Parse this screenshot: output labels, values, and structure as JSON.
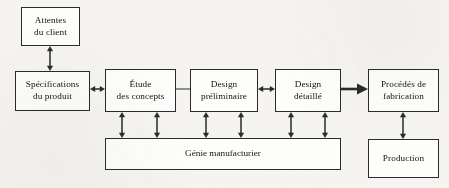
{
  "diagram": {
    "background_color": "#f5f4f1",
    "box_fill_color": "#fdfdfc",
    "line_color": "#2b2b2b",
    "text_color": "#131313",
    "nodes": [
      {
        "id": "attentes",
        "label": "Attentes\ndu client",
        "x": 21,
        "y": 7,
        "w": 59,
        "h": 39
      },
      {
        "id": "specs",
        "label": "Spécifications\ndu produit",
        "x": 15,
        "y": 71,
        "w": 75,
        "h": 40
      },
      {
        "id": "etude",
        "label": "Étude\ndes concepts",
        "x": 105,
        "y": 69,
        "w": 71,
        "h": 43
      },
      {
        "id": "prelim",
        "label": "Design\npréliminaire",
        "x": 190,
        "y": 69,
        "w": 68,
        "h": 43
      },
      {
        "id": "detaille",
        "label": "Design\ndétaillé",
        "x": 275,
        "y": 69,
        "w": 66,
        "h": 43
      },
      {
        "id": "procedes",
        "label": "Procédés de\nfabrication",
        "x": 368,
        "y": 69,
        "w": 71,
        "h": 43
      },
      {
        "id": "production",
        "label": "Production",
        "x": 368,
        "y": 139,
        "w": 71,
        "h": 39
      }
    ],
    "bar": {
      "id": "genie",
      "label": "Génie manufacturier",
      "x": 105,
      "y": 138,
      "w": 236,
      "h": 32
    },
    "connectors": [
      {
        "id": "attentes-specs",
        "kind": "double-vertical",
        "from": "attentes",
        "to": "specs",
        "x": 50,
        "y1": 46,
        "y2": 71
      },
      {
        "id": "specs-etude",
        "kind": "double-horizontal",
        "from": "specs",
        "to": "etude",
        "y": 89,
        "x1": 90,
        "x2": 105
      },
      {
        "id": "etude-prelim",
        "kind": "plain-line",
        "from": "etude",
        "to": "prelim",
        "y": 89,
        "x1": 176,
        "x2": 190
      },
      {
        "id": "prelim-detaille",
        "kind": "double-horizontal",
        "from": "prelim",
        "to": "detaille",
        "y": 89,
        "x1": 258,
        "x2": 275
      },
      {
        "id": "detaille-procedes",
        "kind": "single-arrow",
        "from": "detaille",
        "to": "procedes",
        "y": 89,
        "x1": 341,
        "x2": 368
      },
      {
        "id": "procedes-production",
        "kind": "double-vertical",
        "from": "procedes",
        "to": "production",
        "x": 403,
        "y1": 112,
        "y2": 139
      },
      {
        "id": "etude-genie-left",
        "kind": "double-vertical",
        "from": "etude",
        "to": "genie",
        "x": 122,
        "y1": 112,
        "y2": 138
      },
      {
        "id": "etude-genie-right",
        "kind": "double-vertical",
        "from": "etude",
        "to": "genie",
        "x": 157,
        "y1": 112,
        "y2": 138
      },
      {
        "id": "prelim-genie-left",
        "kind": "double-vertical",
        "from": "prelim",
        "to": "genie",
        "x": 206,
        "y1": 112,
        "y2": 138
      },
      {
        "id": "prelim-genie-right",
        "kind": "double-vertical",
        "from": "prelim",
        "to": "genie",
        "x": 241,
        "y1": 112,
        "y2": 138
      },
      {
        "id": "detaille-genie-left",
        "kind": "double-vertical",
        "from": "detaille",
        "to": "genie",
        "x": 291,
        "y1": 112,
        "y2": 138
      },
      {
        "id": "detaille-genie-right",
        "kind": "double-vertical",
        "from": "detaille",
        "to": "genie",
        "x": 325,
        "y1": 112,
        "y2": 138
      }
    ]
  }
}
